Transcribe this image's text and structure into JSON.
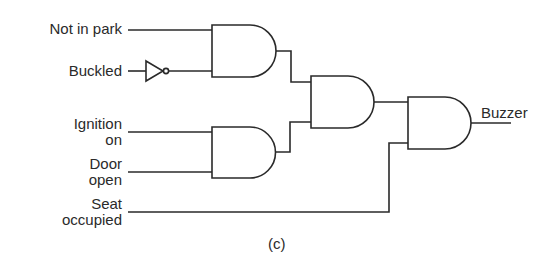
{
  "diagram": {
    "type": "logic-circuit",
    "caption": "(c)",
    "inputs": {
      "not_in_park": "Not in park",
      "buckled": "Buckled",
      "ignition_on_line1": "Ignition",
      "ignition_on_line2": "on",
      "door_open_line1": "Door",
      "door_open_line2": "open",
      "seat_occupied_line1": "Seat",
      "seat_occupied_line2": "occupied"
    },
    "output": "Buzzer",
    "gates": [
      {
        "id": "g1",
        "type": "AND",
        "inputs": [
          "Not in park",
          "NOT(Buckled)"
        ]
      },
      {
        "id": "g2",
        "type": "AND",
        "inputs": [
          "Ignition on",
          "Door open"
        ]
      },
      {
        "id": "g3",
        "type": "AND",
        "inputs": [
          "g1",
          "g2"
        ]
      },
      {
        "id": "g4",
        "type": "AND",
        "inputs": [
          "g3",
          "Seat occupied"
        ],
        "output": "Buzzer"
      }
    ],
    "inverters": [
      {
        "id": "n1",
        "type": "NOT",
        "input": "Buckled"
      }
    ],
    "colors": {
      "line": "#2a2a2a",
      "background": "#ffffff"
    }
  }
}
